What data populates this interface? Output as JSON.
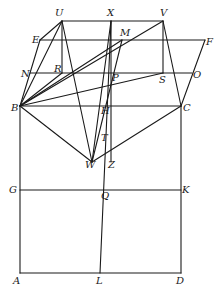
{
  "diagram": {
    "points": {
      "U": [
        62,
        21
      ],
      "X": [
        111,
        21
      ],
      "V": [
        163,
        21
      ],
      "E": [
        40,
        40
      ],
      "M": [
        122,
        40
      ],
      "F": [
        205,
        40
      ],
      "N": [
        30,
        73
      ],
      "R": [
        62,
        73
      ],
      "P": [
        111,
        73
      ],
      "S": [
        163,
        73
      ],
      "O": [
        192,
        73
      ],
      "B": [
        20,
        106
      ],
      "H": [
        103,
        106
      ],
      "C": [
        181,
        106
      ],
      "T": [
        103,
        134
      ],
      "W": [
        92,
        162
      ],
      "Z": [
        111,
        162
      ],
      "G": [
        20,
        190
      ],
      "Q": [
        100,
        190
      ],
      "K": [
        181,
        190
      ],
      "A": [
        20,
        273
      ],
      "L": [
        100,
        273
      ],
      "D": [
        181,
        273
      ]
    },
    "labels": [
      {
        "text": "U",
        "x": 55,
        "y": 16
      },
      {
        "text": "X",
        "x": 107,
        "y": 16
      },
      {
        "text": "V",
        "x": 160,
        "y": 16
      },
      {
        "text": "E",
        "x": 32,
        "y": 43
      },
      {
        "text": "M",
        "x": 120,
        "y": 36
      },
      {
        "text": "F",
        "x": 206,
        "y": 45
      },
      {
        "text": "N",
        "x": 21,
        "y": 77
      },
      {
        "text": "R",
        "x": 54,
        "y": 72
      },
      {
        "text": "P",
        "x": 112,
        "y": 81
      },
      {
        "text": "S",
        "x": 159,
        "y": 83
      },
      {
        "text": "O",
        "x": 193,
        "y": 78
      },
      {
        "text": "B",
        "x": 11,
        "y": 111
      },
      {
        "text": "H",
        "x": 101,
        "y": 114
      },
      {
        "text": "C",
        "x": 183,
        "y": 111
      },
      {
        "text": "T",
        "x": 101,
        "y": 141
      },
      {
        "text": "W",
        "x": 85,
        "y": 168
      },
      {
        "text": "Z",
        "x": 108,
        "y": 168
      },
      {
        "text": "G",
        "x": 9,
        "y": 193
      },
      {
        "text": "Q",
        "x": 101,
        "y": 199
      },
      {
        "text": "K",
        "x": 182,
        "y": 193
      },
      {
        "text": "A",
        "x": 13,
        "y": 284
      },
      {
        "text": "L",
        "x": 96,
        "y": 284
      },
      {
        "text": "D",
        "x": 176,
        "y": 284
      }
    ],
    "segments": [
      [
        "U",
        "V"
      ],
      [
        "E",
        "F"
      ],
      [
        "N",
        "O"
      ],
      [
        "B",
        "C"
      ],
      [
        "G",
        "K"
      ],
      [
        "A",
        "D"
      ],
      [
        "A",
        "B"
      ],
      [
        "D",
        "C"
      ],
      [
        "L",
        "X"
      ],
      [
        "B",
        "E"
      ],
      [
        "E",
        "U"
      ],
      [
        "C",
        "F"
      ],
      [
        "V",
        "C"
      ],
      [
        "U",
        "R"
      ],
      [
        "V",
        "S"
      ],
      [
        "B",
        "U"
      ],
      [
        "B",
        "V"
      ],
      [
        "B",
        "M"
      ],
      [
        "B",
        "S"
      ],
      [
        "B",
        "R"
      ],
      [
        "U",
        "W"
      ],
      [
        "B",
        "W"
      ],
      [
        "W",
        "C"
      ],
      [
        "W",
        "X"
      ],
      [
        "W",
        "M"
      ],
      [
        "X",
        "Z"
      ]
    ]
  }
}
